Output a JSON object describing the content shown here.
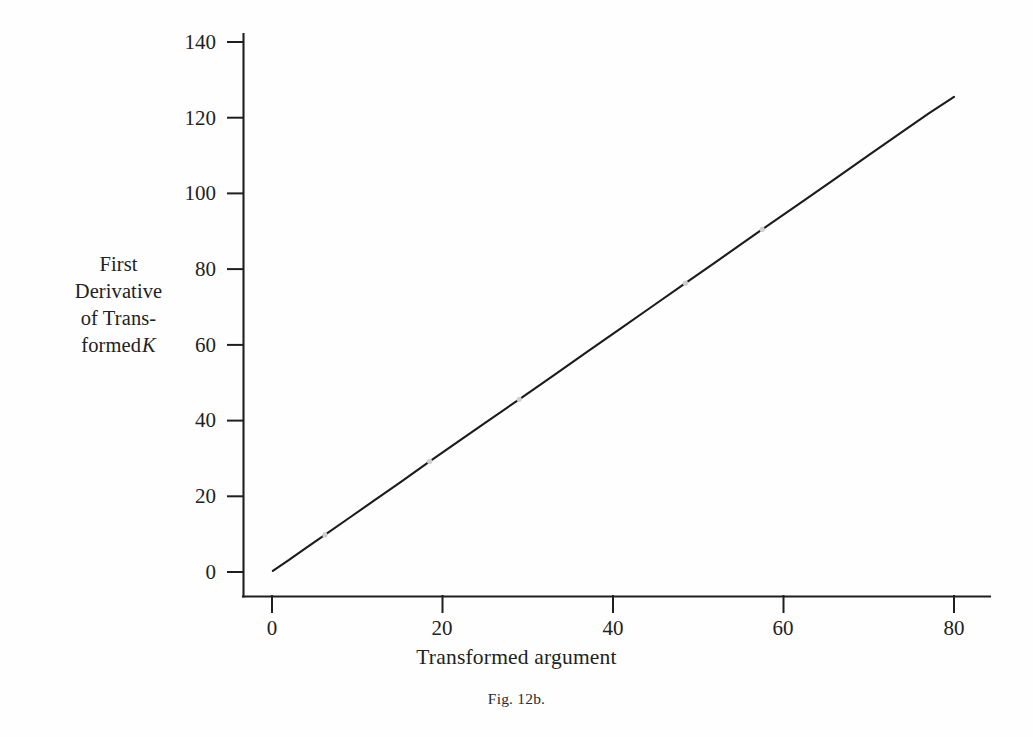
{
  "figure": {
    "caption": "Fig. 12b.",
    "background_color": "#fefefe",
    "ink_color": "#1a1a1a"
  },
  "y_axis_title": {
    "line1": "First",
    "line2": "Derivative",
    "line3": "of Trans-",
    "line4": "formed",
    "variable": "K"
  },
  "x_axis_title": "Transformed argument",
  "axis_ticks": {
    "y": [
      "0",
      "20",
      "40",
      "60",
      "80",
      "100",
      "120",
      "140"
    ],
    "x": [
      "0",
      "20",
      "40",
      "60",
      "80"
    ]
  },
  "chart_data": {
    "type": "line",
    "title": "Fig. 12b.",
    "xlabel": "Transformed argument",
    "ylabel": "First Derivative of Transformed K",
    "xlim": [
      0,
      84
    ],
    "ylim": [
      0,
      148
    ],
    "xticks": [
      0,
      20,
      40,
      60,
      80
    ],
    "yticks": [
      0,
      20,
      40,
      60,
      80,
      100,
      120,
      140
    ],
    "grid": false,
    "legend": false,
    "line_color": "#1c1c1c",
    "line_width_px": 2.1,
    "series": [
      {
        "name": "First derivative of transformed K",
        "x": [
          0.1,
          2,
          4,
          6.2,
          9,
          12,
          15,
          18.5,
          22,
          25,
          29,
          33,
          37,
          41,
          44.5,
          48.5,
          52,
          57.5,
          62,
          66,
          70,
          74,
          77,
          80
        ],
        "y": [
          0.3,
          3.2,
          6.4,
          9.8,
          14.2,
          18.9,
          23.6,
          29.2,
          34.7,
          39.4,
          45.6,
          51.9,
          58.2,
          64.5,
          70.0,
          76.3,
          81.8,
          90.5,
          97.5,
          103.8,
          110.1,
          116.4,
          121.1,
          125.5
        ]
      }
    ],
    "markers": {
      "style": "light-gap-dot",
      "color": "#cfcfcf",
      "points": [
        {
          "x": 6.2,
          "y": 9.8
        },
        {
          "x": 18.5,
          "y": 29.2
        },
        {
          "x": 29.0,
          "y": 45.6
        },
        {
          "x": 48.5,
          "y": 76.3
        },
        {
          "x": 57.5,
          "y": 90.5
        }
      ]
    },
    "annotations": []
  }
}
